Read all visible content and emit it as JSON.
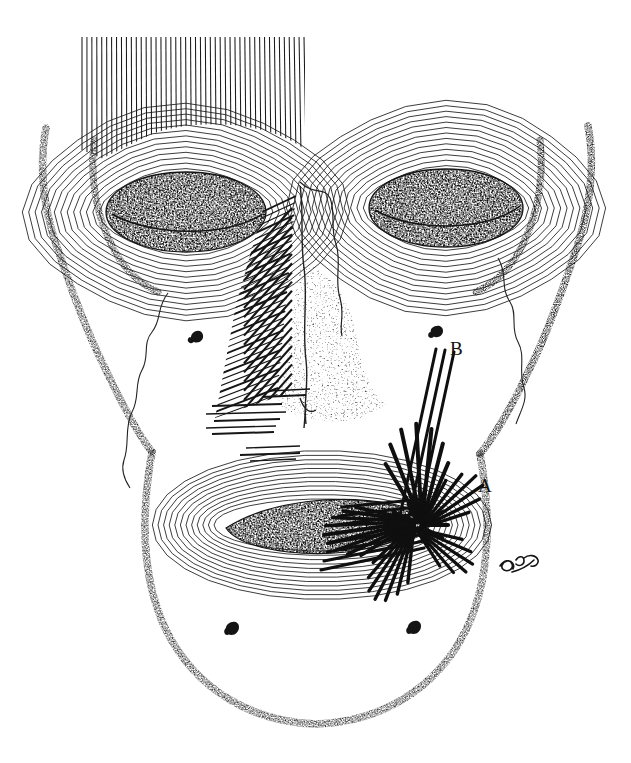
{
  "figure": {
    "domain": "Natural-Image",
    "title": "Anterior view of the skull with facial (mimetic) musculature",
    "medium": "pen-and-ink line drawing",
    "background_color": "#ffffff",
    "ink_color": "#111111",
    "width": 631,
    "height": 763
  },
  "labels": [
    {
      "id": "A",
      "text": "A",
      "x": 478,
      "y": 476,
      "points_to": "modiolus-muscle-convergence"
    },
    {
      "id": "B",
      "text": "B",
      "x": 450,
      "y": 339,
      "points_to": "zygomaticus-fiber-bundle"
    }
  ],
  "signature": {
    "text": "artist-signature",
    "x": 500,
    "y": 560,
    "style": "cursive-monogram"
  },
  "regions": [
    {
      "name": "frontalis-muscle",
      "description": "vertical parallel fibers across forehead",
      "fiber_count": 46
    },
    {
      "name": "orbicularis-oculi-left",
      "description": "concentric polygonal rings around left orbit",
      "ring_count": 13
    },
    {
      "name": "orbicularis-oculi-right",
      "description": "concentric polygonal rings around right orbit",
      "ring_count": 13
    },
    {
      "name": "orbital-cavity-left",
      "description": "dark stippled left eye socket"
    },
    {
      "name": "orbital-cavity-right",
      "description": "dark stippled right eye socket"
    },
    {
      "name": "nasalis-muscle",
      "description": "diagonal hatching over left side of nasal bridge"
    },
    {
      "name": "levator-labii-fibers",
      "description": "horizontal fiber strokes lateral to nasal aperture"
    },
    {
      "name": "nasal-aperture",
      "description": "stippled piriform aperture of the nose"
    },
    {
      "name": "orbicularis-oris",
      "description": "concentric rings encircling the mouth",
      "ring_count": 12
    },
    {
      "name": "oral-fissure",
      "description": "dark stippled mouth opening"
    },
    {
      "name": "modiolus",
      "description": "dense crosshatched convergence of muscle fibers at right mouth corner"
    },
    {
      "name": "zygomatic-arch-left",
      "description": "stippled bone contour, left temple"
    },
    {
      "name": "zygomatic-arch-right",
      "description": "stippled bone contour, right temple"
    },
    {
      "name": "mandible-outline",
      "description": "stippled lower jaw contour"
    },
    {
      "name": "zygomaticomaxillary-suture-left",
      "description": "thin wavy suture line on left cheek"
    },
    {
      "name": "zygomaticomaxillary-suture-right",
      "description": "thin wavy suture line on right cheek"
    },
    {
      "name": "infraorbital-foramen-left",
      "description": "small dark foramen mark, left cheek"
    },
    {
      "name": "infraorbital-foramen-right",
      "description": "small dark foramen mark, right cheek"
    },
    {
      "name": "mental-foramen-left",
      "description": "small dark foramen mark, left mandible"
    },
    {
      "name": "mental-foramen-right",
      "description": "small dark foramen mark, right mandible"
    }
  ]
}
